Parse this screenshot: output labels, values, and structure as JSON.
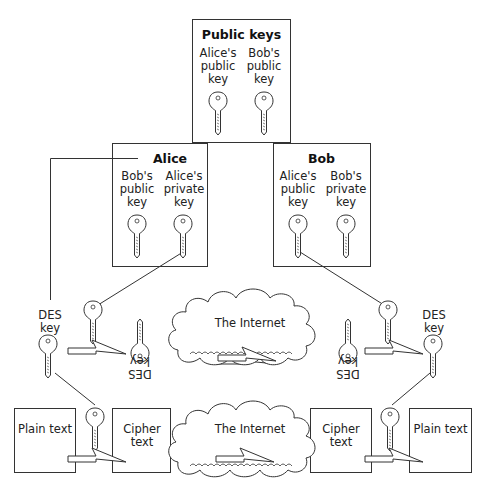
{
  "diagram": {
    "public_keys_box": {
      "title": "Public keys",
      "keys": [
        {
          "label": "Alice's\npublic\nkey"
        },
        {
          "label": "Bob's\npublic\nkey"
        }
      ]
    },
    "alice_box": {
      "title": "Alice",
      "keys": [
        {
          "label": "Bob's\npublic\nkey"
        },
        {
          "label": "Alice's\nprivate\nkey"
        }
      ]
    },
    "bob_box": {
      "title": "Bob",
      "keys": [
        {
          "label": "Alice's\npublic\nkey"
        },
        {
          "label": "Bob's\nprivate\nkey"
        }
      ]
    },
    "middle_row": {
      "left_des_key": "DES\nkey",
      "left_flipped_des_key": "DES\nkey",
      "cloud_label": "The Internet",
      "right_flipped_des_key": "DES\nkey",
      "right_des_key": "DES\nkey"
    },
    "bottom_row": {
      "left_plain": "Plain text",
      "left_cipher": "Cipher text",
      "cloud_label": "The Internet",
      "right_cipher": "Cipher text",
      "right_plain": "Plain text"
    },
    "colors": {
      "stroke": "#333333",
      "background": "#ffffff"
    }
  }
}
